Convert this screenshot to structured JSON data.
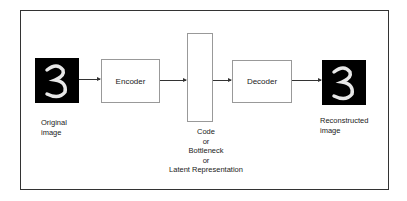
{
  "diagram": {
    "nodes": {
      "input_image": {
        "label_line1": "Original",
        "label_line2": "image",
        "digit": "3"
      },
      "encoder": {
        "label": "Encoder"
      },
      "code": {
        "label_lines": [
          "Code",
          "or",
          "Bottleneck",
          "or",
          "Latent Representation"
        ]
      },
      "decoder": {
        "label": "Decoder"
      },
      "output_image": {
        "label_line1": "Reconstructed",
        "label_line2": "image",
        "digit": "3"
      }
    },
    "edges": [
      {
        "from": "input_image",
        "to": "encoder"
      },
      {
        "from": "encoder",
        "to": "code"
      },
      {
        "from": "code",
        "to": "decoder"
      },
      {
        "from": "decoder",
        "to": "output_image"
      }
    ]
  }
}
